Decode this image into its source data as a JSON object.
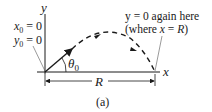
{
  "figure": {
    "caption": "(a)",
    "axes": {
      "x_label": "x",
      "y_label": "y"
    },
    "initial_conditions": {
      "x0": "x",
      "x0_sub": "0",
      "x0_eq": " = 0",
      "y0": "y",
      "y0_sub": "0",
      "y0_eq": " = 0"
    },
    "angle": {
      "symbol": "θ",
      "sub": "0"
    },
    "range": {
      "label": "R"
    },
    "annotation": {
      "line1": "y = 0 again here",
      "line2_pre": "(where ",
      "line2_var": "x",
      "line2_eq": " = ",
      "line2_R": "R",
      "line2_post": ")"
    },
    "colors": {
      "ink": "#1a1a1a",
      "leader": "#555555"
    }
  }
}
